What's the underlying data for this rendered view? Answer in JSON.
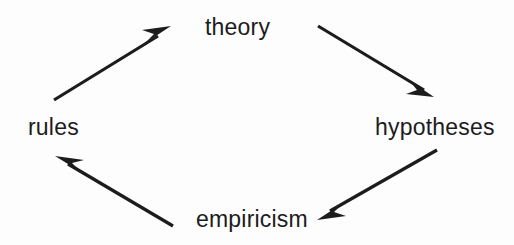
{
  "diagram": {
    "background_color": "#fdfdfd",
    "stroke_color": "#1c1c1c",
    "text_color": "#1c1c1c",
    "nodes": [
      {
        "id": "theory",
        "label": "theory",
        "position": "top"
      },
      {
        "id": "hypotheses",
        "label": "hypotheses",
        "position": "right"
      },
      {
        "id": "empiricism",
        "label": "empiricism",
        "position": "bottom"
      },
      {
        "id": "rules",
        "label": "rules",
        "position": "left"
      }
    ],
    "arrows": [
      {
        "id": "theory-to-hypotheses",
        "from": "theory",
        "to": "hypotheses",
        "direction": "down-right"
      },
      {
        "id": "hypotheses-to-empiricism",
        "from": "hypotheses",
        "to": "empiricism",
        "direction": "down-left"
      },
      {
        "id": "empiricism-to-rules",
        "from": "empiricism",
        "to": "rules",
        "direction": "up-left"
      },
      {
        "id": "rules-to-theory",
        "from": "rules",
        "to": "theory",
        "direction": "up-right"
      }
    ]
  }
}
